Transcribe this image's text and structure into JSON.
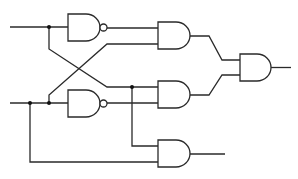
{
  "diagram": {
    "type": "logic-circuit",
    "colors": {
      "stroke": "#2a2a2a",
      "junction": "#111111",
      "background": "#ffffff"
    },
    "inputs": [
      {
        "id": "A",
        "y": 27
      },
      {
        "id": "B",
        "y": 103
      }
    ],
    "gates": [
      {
        "id": "nand-top",
        "kind": "NAND"
      },
      {
        "id": "nand-bottom",
        "kind": "NAND"
      },
      {
        "id": "and-top",
        "kind": "AND"
      },
      {
        "id": "and-middle",
        "kind": "AND"
      },
      {
        "id": "and-final",
        "kind": "AND"
      },
      {
        "id": "and-bottom",
        "kind": "AND"
      }
    ],
    "junction_count": 4
  }
}
